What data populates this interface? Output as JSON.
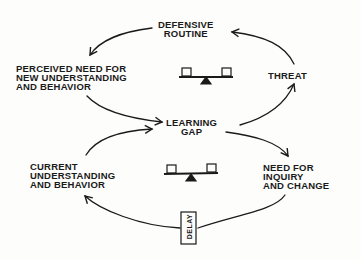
{
  "diagram": {
    "type": "causal-loop",
    "ink_color": "#1a1a1a",
    "nodes": {
      "defensive_routine": "DEFENSIVE\nROUTINE",
      "perceived_need": "PERCEIVED NEED FOR\nNEW UNDERSTANDING\nAND BEHAVIOR",
      "threat": "THREAT",
      "learning_gap": "LEARNING\nGAP",
      "current_understanding": "CURRENT\nUNDERSTANDING\nAND BEHAVIOR",
      "need_for_inquiry": "NEED FOR\nINQUIRY\nAND CHANGE"
    },
    "delay_label": "DELAY",
    "loop_icons": [
      "balance-seesaw-icon",
      "balance-seesaw-icon"
    ],
    "edges": [
      {
        "from": "perceived_need",
        "to": "learning_gap"
      },
      {
        "from": "learning_gap",
        "to": "threat"
      },
      {
        "from": "threat",
        "to": "defensive_routine"
      },
      {
        "from": "defensive_routine",
        "to": "perceived_need"
      },
      {
        "from": "learning_gap",
        "to": "need_for_inquiry"
      },
      {
        "from": "need_for_inquiry",
        "to": "current_understanding",
        "delay": true
      },
      {
        "from": "current_understanding",
        "to": "learning_gap"
      }
    ]
  }
}
